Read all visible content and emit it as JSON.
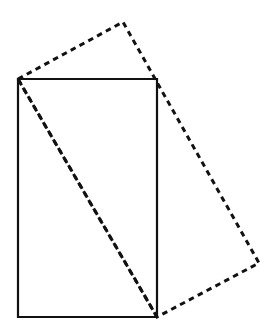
{
  "figure": {
    "background_color": "#ffffff",
    "width": 280,
    "height": 336,
    "stroke_color": "#111111",
    "shapes": [
      {
        "id": "solid-rectangle",
        "name": "solid-rectangle",
        "style": "solid",
        "closed": true,
        "stroke_color": "#111111",
        "stroke_width": 2.2,
        "fill": "none",
        "points": "18,79 157,79 157,317 18,317",
        "vertices": [
          {
            "label": "top-left",
            "x": 18,
            "y": 79
          },
          {
            "label": "top-right",
            "x": 157,
            "y": 79
          },
          {
            "label": "bottom-right",
            "x": 157,
            "y": 317
          },
          {
            "label": "bottom-left",
            "x": 18,
            "y": 317
          }
        ],
        "width_px": 139,
        "height_px": 238
      },
      {
        "id": "dashed-rectangle",
        "name": "dashed-rotated-rectangle",
        "style": "dashed",
        "closed": true,
        "stroke_color": "#111111",
        "stroke_width": 3.0,
        "fill": "none",
        "dash_length": 5.5,
        "dash_gap": 4.5,
        "points": "18,79 123,22 259,263 157,317",
        "vertices": [
          {
            "label": "left",
            "x": 18,
            "y": 79
          },
          {
            "label": "top-apex",
            "x": 123,
            "y": 22
          },
          {
            "label": "right",
            "x": 259,
            "y": 263
          },
          {
            "label": "bottom",
            "x": 157,
            "y": 317
          }
        ]
      }
    ],
    "shared_diagonal": {
      "name": "shared-diagonal",
      "from": {
        "x": 18,
        "y": 79
      },
      "to": {
        "x": 157,
        "y": 317
      },
      "style": "dashed",
      "stroke_width": 3.0
    }
  }
}
